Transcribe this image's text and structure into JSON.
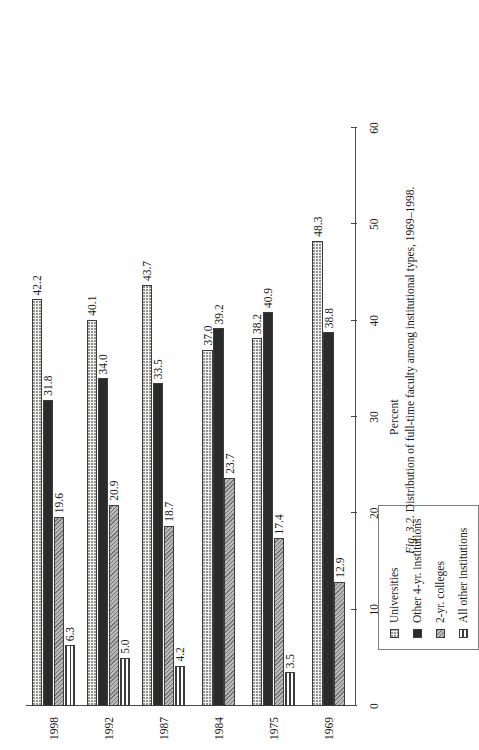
{
  "caption": {
    "figure_number": "Fig. 3.2.",
    "text": "Distribution of full-time faculty among institutional types, 1969–1998."
  },
  "legend": {
    "items": [
      {
        "label": "Universities",
        "swatch": "universities-swatch"
      },
      {
        "label": "Other 4-yr. institutions",
        "swatch": "other-4yr-swatch"
      },
      {
        "label": "2-yr. colleges",
        "swatch": "2yr-swatch"
      },
      {
        "label": "All other institutions",
        "swatch": "all-other-swatch"
      }
    ]
  },
  "chart_data": {
    "type": "bar",
    "title": "Distribution of full-time faculty among institutional types, 1969–1998.",
    "xlabel": "",
    "ylabel": "Percent",
    "ylim": [
      0,
      60
    ],
    "yticks": [
      0,
      10,
      20,
      30,
      40,
      50,
      60
    ],
    "ticklabels": [
      "0",
      "10",
      "20",
      "30",
      "40",
      "50",
      "60"
    ],
    "grid": false,
    "legend_position": "upper-left",
    "orientation": "horizontal-grouped",
    "categories": [
      "1969",
      "1975",
      "1984",
      "1987",
      "1992",
      "1998"
    ],
    "series": [
      {
        "name": "Universities",
        "values": [
          48.3,
          38.2,
          37.0,
          43.7,
          40.1,
          42.2
        ]
      },
      {
        "name": "Other 4-yr. institutions",
        "values": [
          38.8,
          40.9,
          39.2,
          33.5,
          34.0,
          31.8
        ]
      },
      {
        "name": "2-yr. colleges",
        "values": [
          12.9,
          17.4,
          23.7,
          18.7,
          20.9,
          19.6
        ]
      },
      {
        "name": "All other institutions",
        "values": [
          null,
          3.5,
          null,
          4.2,
          5.0,
          6.3
        ]
      }
    ],
    "data_labels": {
      "1969": {
        "Universities": "48.3",
        "Other 4-yr. institutions": "38.8",
        "2-yr. colleges": "12.9",
        "All other institutions": ""
      },
      "1975": {
        "Universities": "38.2",
        "Other 4-yr. institutions": "40.9",
        "2-yr. colleges": "17.4",
        "All other institutions": "3.5"
      },
      "1984": {
        "Universities": "37.0",
        "Other 4-yr. institutions": "39.2",
        "2-yr. colleges": "23.7",
        "All other institutions": ""
      },
      "1987": {
        "Universities": "43.7",
        "Other 4-yr. institutions": "33.5",
        "2-yr. colleges": "18.7",
        "All other institutions": "4.2"
      },
      "1992": {
        "Universities": "40.1",
        "Other 4-yr. institutions": "34.0",
        "2-yr. colleges": "20.9",
        "All other institutions": "5.0"
      },
      "1998": {
        "Universities": "42.2",
        "Other 4-yr. institutions": "31.8",
        "2-yr. colleges": "19.6",
        "All other institutions": "6.3"
      }
    }
  }
}
